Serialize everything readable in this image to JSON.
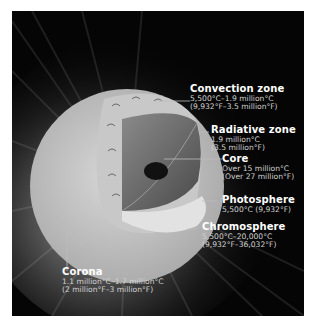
{
  "diagram": {
    "colors": {
      "background": "#050505",
      "page": "#ffffff",
      "text_title": "#ffffff",
      "text_sub": "#d0d0d0",
      "leader_line": "#bdbdbd"
    },
    "layers": [
      {
        "name": "Convection zone",
        "line1": "5,500°C–1.9 million°C",
        "line2": "(9,932°F–3.5 million°F)"
      },
      {
        "name": "Radiative zone",
        "line1": "1.9 million°C",
        "line2": "(3.5 million°F)"
      },
      {
        "name": "Core",
        "line1": "Over 15 million°C",
        "line2": "(Over 27 million°F)"
      },
      {
        "name": "Photosphere",
        "line1": "5,500°C (9,932°F)",
        "line2": ""
      },
      {
        "name": "Chromosphere",
        "line1": "5,500°C–20,000°C",
        "line2": "(9,932°F–36,032°F)"
      },
      {
        "name": "Corona",
        "line1": "1.1 million°C–1.7 million°C",
        "line2": "(2 million°F–3 million°F)"
      }
    ]
  }
}
